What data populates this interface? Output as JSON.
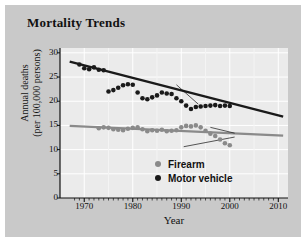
{
  "title": "Mortality Trends",
  "chart_data": {
    "type": "scatter",
    "title": "Mortality Trends",
    "xlabel": "Year",
    "ylabel_line1": "Annual deaths",
    "ylabel_line2": "(per 100,000 persons)",
    "xlim": [
      1965,
      2012
    ],
    "ylim": [
      0,
      31
    ],
    "xticks": [
      1970,
      1980,
      1990,
      2000,
      2010
    ],
    "yticks": [
      0,
      5,
      10,
      15,
      20,
      25,
      30
    ],
    "grid": true,
    "legend_position": "bottom-right",
    "series": [
      {
        "name": "Firearm",
        "color": "#8a8a8a",
        "marker": "circle",
        "trendline": {
          "x": [
            1967,
            2011
          ],
          "y": [
            14.9,
            12.9
          ],
          "color": "#8a8a8a"
        },
        "points": [
          {
            "x": 1973,
            "y": 14.4
          },
          {
            "x": 1974,
            "y": 14.6
          },
          {
            "x": 1975,
            "y": 14.5
          },
          {
            "x": 1976,
            "y": 14.2
          },
          {
            "x": 1977,
            "y": 14.1
          },
          {
            "x": 1978,
            "y": 14.0
          },
          {
            "x": 1979,
            "y": 14.3
          },
          {
            "x": 1980,
            "y": 14.5
          },
          {
            "x": 1981,
            "y": 14.6
          },
          {
            "x": 1982,
            "y": 14.2
          },
          {
            "x": 1983,
            "y": 13.8
          },
          {
            "x": 1984,
            "y": 14.0
          },
          {
            "x": 1985,
            "y": 13.9
          },
          {
            "x": 1986,
            "y": 14.1
          },
          {
            "x": 1987,
            "y": 13.8
          },
          {
            "x": 1988,
            "y": 13.9
          },
          {
            "x": 1989,
            "y": 14.0
          },
          {
            "x": 1990,
            "y": 14.6
          },
          {
            "x": 1991,
            "y": 14.9
          },
          {
            "x": 1992,
            "y": 14.8
          },
          {
            "x": 1993,
            "y": 15.0
          },
          {
            "x": 1994,
            "y": 14.6
          },
          {
            "x": 1995,
            "y": 13.9
          },
          {
            "x": 1996,
            "y": 13.3
          },
          {
            "x": 1997,
            "y": 12.8
          },
          {
            "x": 1998,
            "y": 12.1
          },
          {
            "x": 1999,
            "y": 11.3
          },
          {
            "x": 2000,
            "y": 10.9
          }
        ]
      },
      {
        "name": "Motor vehicle",
        "color": "#1a1a1a",
        "marker": "circle",
        "trendline": {
          "x": [
            1967,
            2011
          ],
          "y": [
            28.2,
            16.8
          ],
          "color": "#1a1a1a"
        },
        "points": [
          {
            "x": 1969,
            "y": 27.6
          },
          {
            "x": 1970,
            "y": 26.8
          },
          {
            "x": 1971,
            "y": 26.6
          },
          {
            "x": 1972,
            "y": 27.0
          },
          {
            "x": 1973,
            "y": 26.5
          },
          {
            "x": 1974,
            "y": 26.4
          },
          {
            "x": 1975,
            "y": 22.0
          },
          {
            "x": 1976,
            "y": 22.3
          },
          {
            "x": 1977,
            "y": 22.8
          },
          {
            "x": 1978,
            "y": 23.3
          },
          {
            "x": 1979,
            "y": 23.5
          },
          {
            "x": 1980,
            "y": 23.4
          },
          {
            "x": 1981,
            "y": 21.8
          },
          {
            "x": 1982,
            "y": 20.6
          },
          {
            "x": 1983,
            "y": 20.4
          },
          {
            "x": 1984,
            "y": 20.8
          },
          {
            "x": 1985,
            "y": 21.2
          },
          {
            "x": 1986,
            "y": 21.8
          },
          {
            "x": 1987,
            "y": 21.6
          },
          {
            "x": 1988,
            "y": 21.5
          },
          {
            "x": 1989,
            "y": 20.6
          },
          {
            "x": 1990,
            "y": 20.0
          },
          {
            "x": 1991,
            "y": 19.1
          },
          {
            "x": 1992,
            "y": 18.4
          },
          {
            "x": 1993,
            "y": 18.8
          },
          {
            "x": 1994,
            "y": 18.9
          },
          {
            "x": 1995,
            "y": 19.0
          },
          {
            "x": 1996,
            "y": 19.1
          },
          {
            "x": 1997,
            "y": 19.2
          },
          {
            "x": 1998,
            "y": 19.0
          },
          {
            "x": 1999,
            "y": 19.1
          },
          {
            "x": 2000,
            "y": 19.0
          }
        ]
      }
    ],
    "annotations": [
      {
        "name": "motor-vehicle-leader",
        "x1": 1993.5,
        "y1": 19.4,
        "x2": 1989.0,
        "y2": 23.4
      },
      {
        "name": "firearm-leader-upper",
        "x1": 2001.0,
        "y1": 13.4,
        "x2": 1996.0,
        "y2": 14.6
      },
      {
        "name": "firearm-leader-lower",
        "x1": 2001.0,
        "y1": 12.6,
        "x2": 1990.5,
        "y2": 10.6
      }
    ]
  },
  "legend": {
    "items": [
      {
        "label": "Firearm",
        "color": "#8a8a8a"
      },
      {
        "label": "Motor vehicle",
        "color": "#1a1a1a"
      }
    ]
  }
}
